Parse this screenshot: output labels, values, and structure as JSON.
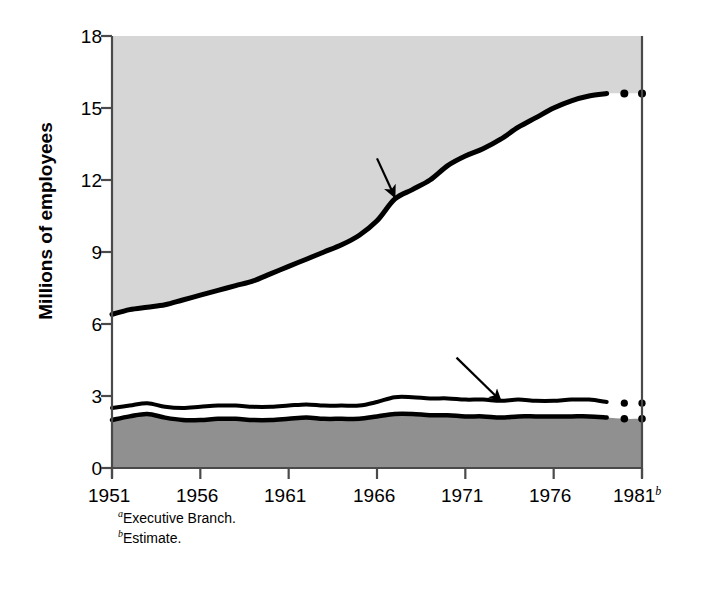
{
  "chart_data": {
    "type": "area",
    "title": "",
    "xlabel": "",
    "ylabel": "Millions of employees",
    "xlim": [
      1951,
      1981
    ],
    "ylim": [
      0,
      18
    ],
    "grid": false,
    "legend_position": "inline-annotations",
    "x_ticks": [
      "1951",
      "1956",
      "1961",
      "1966",
      "1971",
      "1976",
      "1981"
    ],
    "x_tick_values": [
      1951,
      1956,
      1961,
      1966,
      1971,
      1976,
      1981
    ],
    "x_last_tick_superscript": "b",
    "y_ticks": [
      "0",
      "3",
      "6",
      "9",
      "12",
      "15",
      "18"
    ],
    "y_tick_values": [
      0,
      3,
      6,
      9,
      12,
      15,
      18
    ],
    "x": [
      1951,
      1952,
      1953,
      1954,
      1955,
      1956,
      1957,
      1958,
      1959,
      1960,
      1961,
      1962,
      1963,
      1964,
      1965,
      1966,
      1967,
      1968,
      1969,
      1970,
      1971,
      1972,
      1973,
      1974,
      1975,
      1976,
      1977,
      1978,
      1979,
      1980,
      1981
    ],
    "series": [
      {
        "name": "Total",
        "label": "Total",
        "style": "solid-with-dotted-estimate",
        "values": [
          6.4,
          6.6,
          6.7,
          6.8,
          7.0,
          7.2,
          7.4,
          7.6,
          7.8,
          8.1,
          8.4,
          8.7,
          9.0,
          9.3,
          9.7,
          10.3,
          11.2,
          11.6,
          12.0,
          12.6,
          13.0,
          13.3,
          13.7,
          14.2,
          14.6,
          15.0,
          15.3,
          15.5,
          15.6,
          15.6,
          15.6
        ]
      },
      {
        "name": "Federal plus Postal Service",
        "label": "Postal Service",
        "style": "solid-with-dotted-estimate",
        "values": [
          2.5,
          2.6,
          2.7,
          2.55,
          2.5,
          2.55,
          2.6,
          2.6,
          2.55,
          2.55,
          2.6,
          2.65,
          2.6,
          2.6,
          2.6,
          2.75,
          2.95,
          2.95,
          2.9,
          2.9,
          2.85,
          2.85,
          2.8,
          2.85,
          2.8,
          2.8,
          2.85,
          2.85,
          2.75,
          2.7,
          2.7
        ]
      },
      {
        "name": "Federal",
        "label": "Federal",
        "label_superscript": "a",
        "style": "solid-with-dotted-estimate",
        "values": [
          2.0,
          2.15,
          2.25,
          2.1,
          2.0,
          2.0,
          2.05,
          2.05,
          2.0,
          2.0,
          2.05,
          2.1,
          2.05,
          2.05,
          2.05,
          2.15,
          2.25,
          2.25,
          2.2,
          2.2,
          2.15,
          2.15,
          2.1,
          2.15,
          2.15,
          2.15,
          2.15,
          2.15,
          2.1,
          2.05,
          2.05
        ]
      }
    ],
    "annotations": [
      {
        "text": "Total",
        "x": 1966.0,
        "y": 12.9,
        "arrow": true,
        "arrow_to_x": 1967.0,
        "arrow_to_y": 11.3
      },
      {
        "text": "State and local",
        "x": 1962.0,
        "y": 7.5,
        "arrow": false
      },
      {
        "text": "Postal Service",
        "x": 1970.5,
        "y": 4.6,
        "arrow": true,
        "arrow_to_x": 1973.0,
        "arrow_to_y": 2.8
      },
      {
        "text": "Federal",
        "superscript": "a",
        "x": 1962.5,
        "y": 0.85,
        "arrow": false
      }
    ],
    "footnotes": [
      {
        "marker": "a",
        "text": "Executive Branch."
      },
      {
        "marker": "b",
        "text": "Estimate."
      }
    ],
    "colors": {
      "state_and_local_fill": "#ffffff",
      "upper_fill": "#d6d6d6",
      "federal_fill": "#909090",
      "line": "#000000",
      "axis": "#4a4a4a",
      "text": "#000000",
      "background": "#ffffff"
    }
  }
}
